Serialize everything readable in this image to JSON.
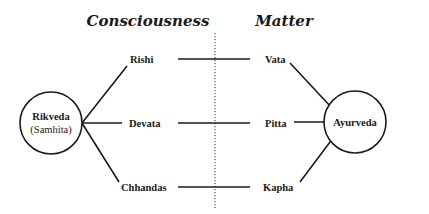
{
  "headings": {
    "left": "Consciousness",
    "right": "Matter"
  },
  "left_node": {
    "line1": "Rikveda",
    "line2": "(Samhita)"
  },
  "right_node": {
    "label": "Ayurveda"
  },
  "left_items": [
    "Rishi",
    "Devata",
    "Chhandas"
  ],
  "right_items": [
    "Vata",
    "Pitta",
    "Kapha"
  ],
  "colors": {
    "ink": "#1a1a1a",
    "background": "#ffffff"
  }
}
